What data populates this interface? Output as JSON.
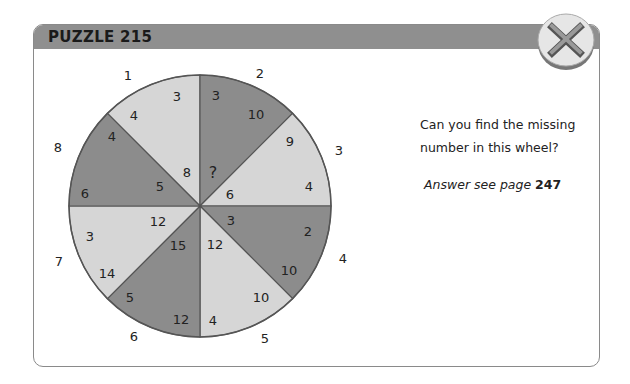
{
  "header": {
    "title": "PUZZLE 215"
  },
  "close_button": {
    "icon": "close-x-icon",
    "label": "Close"
  },
  "question": {
    "line1": "Can you find the missing",
    "line2": "number in this wheel?"
  },
  "answer": {
    "prefix": "Answer see page",
    "page": "247"
  },
  "colors": {
    "header": "#8f8f8f",
    "dark_segment": "#8c8c8c",
    "light_segment": "#d6d6d6",
    "border": "#555555",
    "text": "#222222"
  },
  "wheel": {
    "outer_labels": [
      "1",
      "2",
      "3",
      "4",
      "5",
      "6",
      "7",
      "8"
    ],
    "segments": [
      {
        "id": 1,
        "shade": "light",
        "values": [
          "3",
          "4",
          "8"
        ]
      },
      {
        "id": 2,
        "shade": "dark",
        "values": [
          "3",
          "10",
          "?"
        ]
      },
      {
        "id": 3,
        "shade": "light",
        "values": [
          "9",
          "4",
          "6"
        ]
      },
      {
        "id": 4,
        "shade": "dark",
        "values": [
          "2",
          "10",
          "3"
        ]
      },
      {
        "id": 5,
        "shade": "light",
        "values": [
          "10",
          "4",
          "12"
        ]
      },
      {
        "id": 6,
        "shade": "dark",
        "values": [
          "12",
          "5",
          "15"
        ]
      },
      {
        "id": 7,
        "shade": "light",
        "values": [
          "3",
          "14",
          "12"
        ]
      },
      {
        "id": 8,
        "shade": "dark",
        "values": [
          "4",
          "6",
          "5"
        ]
      }
    ]
  }
}
